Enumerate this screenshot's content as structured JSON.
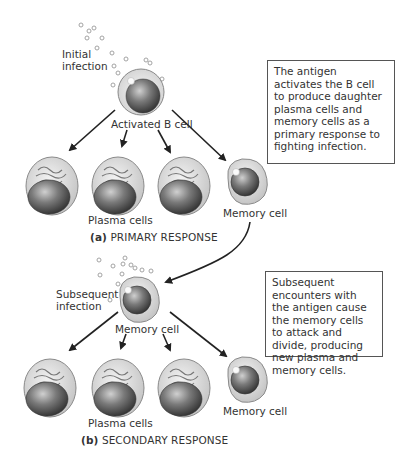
{
  "primary": {
    "initial_infection_label": "Initial infection",
    "activated_cell_label": "Activated B cell",
    "plasma_cells_label": "Plasma cells",
    "memory_cell_label": "Memory cell",
    "caption_letter": "(a)",
    "caption_text": "PRIMARY RESPONSE",
    "description": "The antigen activates the B cell to produce daughter plasma cells and memory cells as a primary response to fighting infection."
  },
  "secondary": {
    "subsequent_infection_label": "Subsequent infection",
    "memory_cell_label": "Memory cell",
    "plasma_cells_label": "Plasma cells",
    "memory_cell_out_label": "Memory cell",
    "caption_letter": "(b)",
    "caption_text": "SECONDARY RESPONSE",
    "description": "Subsequent encounters with the antigen cause the memory cells to attack and divide, producing new plasma and memory cells."
  },
  "colors": {
    "arrow": "#222222",
    "cell_membrane": "#c9c9c9",
    "nucleus": "#555555",
    "box_border": "#555555"
  }
}
